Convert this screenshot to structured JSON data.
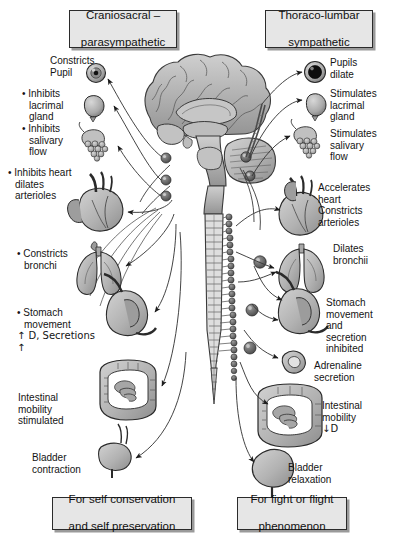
{
  "diagram": {
    "title_left": "Craniosacral – parasympathetic",
    "title_right": "Thoraco-lumbar sympathetic",
    "colors": {
      "box_fill": "#e6e6e6",
      "box_border": "#2b2b2b",
      "box_shadow": "#9a9a9a",
      "organ_fill": "#b8b8b8",
      "organ_dark": "#8f8f8f",
      "line": "#3a3a3a",
      "background": "#ffffff"
    }
  },
  "headers": {
    "left": {
      "line1": "Craniosacral –",
      "line2": "parasympathetic"
    },
    "right": {
      "line1": "Thoraco-lumbar",
      "line2": "sympathetic"
    }
  },
  "footers": {
    "left": {
      "line1": "For self conservation",
      "line2": "and self preservation"
    },
    "right": {
      "line1": "For fight or flight",
      "line2": "phenomenon"
    }
  },
  "parasympathetic_effects": [
    {
      "id": "pupil",
      "text": "Constricts\nPupil",
      "bullet": false,
      "organ": "eye-constricted-icon"
    },
    {
      "id": "lacrimal",
      "text": "• Inhibits\n   lacrimal\n   gland",
      "bullet": true,
      "organ": "lacrimal-gland-icon"
    },
    {
      "id": "salivary",
      "text": "• Inhibits\n   salivary\n   flow",
      "bullet": true,
      "organ": "salivary-gland-icon"
    },
    {
      "id": "heart",
      "text": "• Inhibits heart\n   dilates\n   arterioles",
      "bullet": true,
      "organ": "heart-icon"
    },
    {
      "id": "bronchi",
      "text": "• Constricts\n   bronchi",
      "bullet": true,
      "organ": "lungs-icon"
    },
    {
      "id": "stomach",
      "text": "• Stomach\n   movement\n   ↑ D, Secretions\n   ↑",
      "bullet": true,
      "organ": "stomach-icon"
    },
    {
      "id": "intestine",
      "text": "Intestinal\nmobility\nstimulated",
      "bullet": false,
      "organ": "intestine-icon"
    },
    {
      "id": "bladder",
      "text": "Bladder\ncontraction",
      "bullet": false,
      "organ": "bladder-contracted-icon"
    }
  ],
  "sympathetic_effects": [
    {
      "id": "pupil",
      "text": "Pupils\ndilate",
      "organ": "eye-dilated-icon"
    },
    {
      "id": "lacrimal",
      "text": "Stimulates\nlacrimal\ngland",
      "organ": "lacrimal-gland-icon"
    },
    {
      "id": "salivary",
      "text": "Stimulates\nsalivary\nflow",
      "organ": "salivary-gland-icon"
    },
    {
      "id": "heart",
      "text": "Accelerates\nheart\nConstricts\narterioles",
      "organ": "heart-icon"
    },
    {
      "id": "bronchi",
      "text": "Dilates\nbronchii",
      "organ": "lungs-icon"
    },
    {
      "id": "stomach",
      "text": "Stomach\nmovement\nand\nsecretion\ninhibited",
      "organ": "stomach-icon"
    },
    {
      "id": "adrenaline",
      "text": "Adrenaline\nsecretion",
      "organ": "adrenal-gland-icon"
    },
    {
      "id": "intestine",
      "text": "Intestinal\nmobility\n↓D",
      "organ": "intestine-icon"
    },
    {
      "id": "bladder",
      "text": "Bladder\nrelaxation",
      "organ": "bladder-relaxed-icon"
    }
  ],
  "labels": {
    "l_pupil_1": "Constricts",
    "l_pupil_2": "Pupil",
    "l_lac_1": "• Inhibits",
    "l_lac_2": "lacrimal",
    "l_lac_3": "gland",
    "l_sal_1": "• Inhibits",
    "l_sal_2": "salivary",
    "l_sal_3": "flow",
    "l_hrt_1": "• Inhibits heart",
    "l_hrt_2": "dilates",
    "l_hrt_3": "arterioles",
    "l_brn_1": "• Constricts",
    "l_brn_2": "bronchi",
    "l_sto_1": "• Stomach",
    "l_sto_2": "movement",
    "l_sto_3": "↑ D, Secretions",
    "l_sto_4": "↑",
    "l_int_1": "Intestinal",
    "l_int_2": "mobility",
    "l_int_3": "stimulated",
    "l_bld_1": "Bladder",
    "l_bld_2": "contraction",
    "r_pupil_1": "Pupils",
    "r_pupil_2": "dilate",
    "r_lac_1": "Stimulates",
    "r_lac_2": "lacrimal",
    "r_lac_3": "gland",
    "r_sal_1": "Stimulates",
    "r_sal_2": "salivary",
    "r_sal_3": "flow",
    "r_hrt_1": "Accelerates",
    "r_hrt_2": "heart",
    "r_hrt_3": "Constricts",
    "r_hrt_4": "arterioles",
    "r_brn_1": "Dilates",
    "r_brn_2": "bronchii",
    "r_sto_1": "Stomach",
    "r_sto_2": "movement",
    "r_sto_3": "and",
    "r_sto_4": "secretion",
    "r_sto_5": "inhibited",
    "r_adr_1": "Adrenaline",
    "r_adr_2": "secretion",
    "r_int_1": "Intestinal",
    "r_int_2": "mobility",
    "r_int_3": "↓D",
    "r_bld_1": "Bladder",
    "r_bld_2": "relaxation"
  },
  "anatomy": {
    "brain": "brain-sagittal-icon",
    "cerebellum": "cerebellum-icon",
    "brainstem": "brainstem-icon",
    "spinal_cord": "spinal-cord-icon",
    "sympathetic_chain": "sympathetic-chain-icon",
    "ganglia_left": "parasympathetic-ganglia-icon",
    "ganglia_right": "sympathetic-ganglia-icon"
  }
}
